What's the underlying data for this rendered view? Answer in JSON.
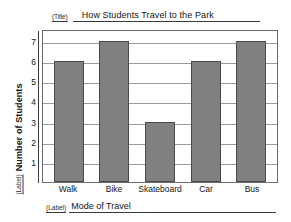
{
  "worksheet": {
    "title_tag": "(Title)",
    "ylabel_tag": "(Label)",
    "xlabel_tag": "(Label)"
  },
  "chart_data": {
    "type": "bar",
    "title": "How Students Travel to the Park",
    "xlabel": "Mode of Travel",
    "ylabel": "Number of Students",
    "categories": [
      "Walk",
      "Bike",
      "Skateboard",
      "Car",
      "Bus"
    ],
    "values": [
      6,
      7,
      3,
      6,
      7
    ],
    "yticks": [
      7,
      6,
      5,
      4,
      3,
      2,
      1
    ],
    "ylim": [
      0,
      7.6
    ],
    "grid": true,
    "legend": false,
    "bar_color": "#808080",
    "bar_edge_color": "#4a4a4a",
    "grid_color": "#9a9a9a",
    "frame_color": "#6e6e6e"
  }
}
